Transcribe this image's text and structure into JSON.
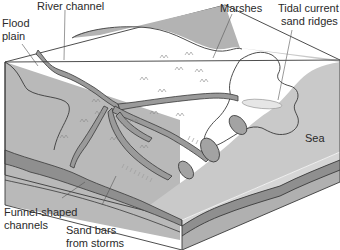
{
  "diagram": {
    "type": "block-diagram",
    "labels": {
      "flood_plain_line1": "Flood",
      "flood_plain_line2": "plain",
      "river_channel": "River channel",
      "marshes": "Marshes",
      "tidal_line1": "Tidal current",
      "tidal_line2": "sand ridges",
      "sea": "Sea",
      "funnel_line1": "Funnel-shaped",
      "funnel_line2": "channels",
      "sandbars_line1": "Sand bars",
      "sandbars_line2": "from storms"
    },
    "colors": {
      "land": "#bdbdbd",
      "upland": "#b3b3b3",
      "channel": "#9a9a9a",
      "sea": "#c9c9c9",
      "tidal_zone": "#a8a8a8",
      "sand_ridge": "#e6e6e6",
      "side_top_layer": "#d6d6d6",
      "side_mid_layer": "#8f8f8f",
      "side_bottom_layer": "#b0b0b0",
      "outline": "#3a3a3a",
      "text": "#2a2a2a"
    }
  }
}
